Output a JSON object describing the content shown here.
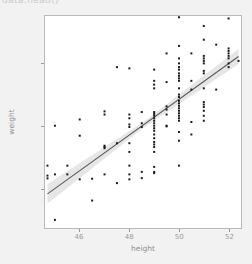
{
  "figure": {
    "background_color": "#f2f2f2",
    "panel_background_color": "#ffffff",
    "panel_border_color": "#b9b9b9",
    "clipped_top_text": "data.head()"
  },
  "chart_data": {
    "type": "scatter",
    "title": "",
    "xlabel": "height",
    "ylabel": "weight",
    "xlim": [
      44.6,
      52.5
    ],
    "ylim": [
      2180,
      3880
    ],
    "xticks": [
      46,
      48,
      50,
      52
    ],
    "xtick_labels": [
      "46",
      "48",
      "50",
      "52"
    ],
    "yticks": [
      2500,
      3000,
      3500
    ],
    "ytick_labels": [
      "2500",
      "3000",
      "3500"
    ],
    "grid": false,
    "legend": false,
    "point_color": "#1a1a1a",
    "point_size": 2,
    "regression": {
      "line_color": "#595959",
      "band_color": "#c8c8c8",
      "band_opacity": 0.45,
      "slope": 143.0,
      "intercept": -3940.0,
      "x_start": 44.7,
      "x_end": 52.4,
      "y_start": 2454,
      "y_end": 3555,
      "band_halfwidth_start": 78,
      "band_halfwidth_mid": 24,
      "band_halfwidth_end": 60
    },
    "x": [
      44.7,
      44.7,
      44.7,
      45.0,
      45.0,
      45.0,
      45.5,
      45.5,
      46.0,
      46.0,
      46.0,
      46.5,
      46.5,
      47.0,
      47.0,
      47.0,
      47.0,
      47.0,
      47.0,
      47.5,
      47.5,
      47.5,
      48.0,
      48.0,
      48.0,
      48.0,
      48.0,
      48.0,
      48.0,
      48.0,
      48.0,
      48.0,
      48.5,
      48.5,
      48.5,
      48.5,
      48.5,
      49.0,
      49.0,
      49.0,
      49.0,
      49.0,
      49.0,
      49.0,
      49.0,
      49.0,
      49.0,
      49.0,
      49.0,
      49.0,
      49.0,
      49.0,
      49.0,
      49.0,
      49.0,
      49.0,
      49.0,
      49.0,
      49.0,
      49.5,
      49.5,
      49.5,
      49.5,
      49.5,
      49.5,
      49.5,
      50.0,
      50.0,
      50.0,
      50.0,
      50.0,
      50.0,
      50.0,
      50.0,
      50.0,
      50.0,
      50.0,
      50.0,
      50.0,
      50.0,
      50.0,
      50.0,
      50.0,
      50.0,
      50.0,
      50.0,
      50.0,
      50.0,
      50.0,
      50.0,
      50.0,
      50.5,
      50.5,
      50.5,
      50.5,
      50.5,
      51.0,
      51.0,
      51.0,
      51.0,
      51.0,
      51.0,
      51.0,
      51.0,
      51.0,
      51.0,
      51.0,
      51.0,
      51.0,
      51.0,
      51.0,
      51.5,
      51.5,
      52.0,
      52.0,
      52.0,
      52.0,
      52.0,
      52.0,
      52.0,
      52.0,
      52.4
    ],
    "y": [
      2680,
      2600,
      2578,
      2610,
      3000,
      2245,
      2680,
      2610,
      2920,
      3050,
      2570,
      2575,
      2400,
      2840,
      2830,
      2820,
      3115,
      3090,
      2610,
      2540,
      3470,
      2860,
      3090,
      3010,
      2990,
      2860,
      2680,
      2610,
      2570,
      3460,
      3060,
      2790,
      3110,
      3020,
      2990,
      2630,
      2580,
      3110,
      3095,
      3080,
      3060,
      3040,
      3020,
      3000,
      2980,
      2960,
      2930,
      2900,
      2870,
      2850,
      2830,
      2790,
      2670,
      2620,
      3360,
      3330,
      3300,
      3450,
      2630,
      3155,
      3130,
      3090,
      3000,
      2995,
      3580,
      3350,
      3870,
      3640,
      3540,
      3500,
      3470,
      3450,
      3420,
      3400,
      3380,
      3360,
      3300,
      3250,
      3230,
      3200,
      3180,
      3160,
      3140,
      3120,
      3100,
      3080,
      3060,
      3040,
      2950,
      2880,
      2680,
      3580,
      3360,
      3290,
      3030,
      2930,
      3800,
      3690,
      3560,
      3540,
      3520,
      3500,
      3440,
      3420,
      3300,
      3190,
      3170,
      3150,
      3120,
      3080,
      3040,
      3650,
      3290,
      3860,
      3620,
      3600,
      3580,
      3560,
      3540,
      3500,
      3470,
      3520
    ]
  }
}
